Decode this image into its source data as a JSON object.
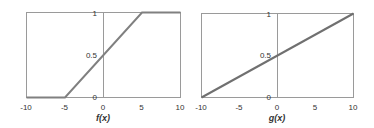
{
  "chart_data": [
    {
      "type": "line",
      "title": "",
      "xlabel": "f(x)",
      "ylabel": "",
      "xlim": [
        -10,
        10
      ],
      "ylim": [
        0,
        1
      ],
      "x_ticks": [
        "-10",
        "-5",
        "0",
        "5",
        "10"
      ],
      "y_ticks": [
        "0",
        "0.5",
        "1"
      ],
      "grid": false,
      "series": [
        {
          "name": "f(x)",
          "x": [
            -10,
            -5,
            5,
            10
          ],
          "y": [
            0,
            0,
            1,
            1
          ],
          "color": "#808080"
        }
      ]
    },
    {
      "type": "line",
      "title": "",
      "xlabel": "g(x)",
      "ylabel": "",
      "xlim": [
        -10,
        10
      ],
      "ylim": [
        0,
        1
      ],
      "x_ticks": [
        "-10",
        "-5",
        "0",
        "5",
        "10"
      ],
      "y_ticks": [
        "0",
        "0.5",
        "1"
      ],
      "grid": false,
      "series": [
        {
          "name": "g(x)",
          "x": [
            -10,
            10
          ],
          "y": [
            0,
            1
          ],
          "color": "#707070"
        }
      ]
    }
  ]
}
